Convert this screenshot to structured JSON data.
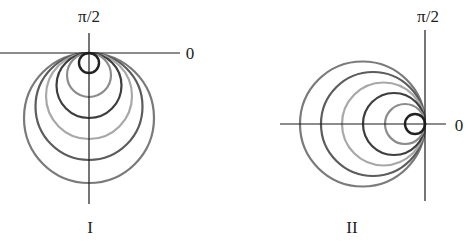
{
  "figure": {
    "panels": [
      {
        "id": "I",
        "caption": "I",
        "angle_label_top": "π/2",
        "angle_label_right": "0",
        "origin": [
          89,
          53
        ],
        "direction": "down",
        "circles": [
          {
            "diameter": 130,
            "color": "#7a7a7a"
          },
          {
            "diameter": 107,
            "color": "#5c5c5c"
          },
          {
            "diameter": 86,
            "color": "#a8a8a8"
          },
          {
            "diameter": 65,
            "color": "#3e3e3e"
          },
          {
            "diameter": 44,
            "color": "#8c8c8c"
          },
          {
            "diameter": 20,
            "color": "#222222"
          }
        ]
      },
      {
        "id": "II",
        "caption": "II",
        "angle_label_top": "π/2",
        "angle_label_right": "0",
        "origin": [
          425,
          124
        ],
        "direction": "left",
        "circles": [
          {
            "diameter": 125,
            "color": "#7a7a7a"
          },
          {
            "diameter": 104,
            "color": "#5c5c5c"
          },
          {
            "diameter": 83,
            "color": "#a8a8a8"
          },
          {
            "diameter": 62,
            "color": "#3e3e3e"
          },
          {
            "diameter": 40,
            "color": "#8c8c8c"
          },
          {
            "diameter": 20,
            "color": "#222222"
          }
        ]
      }
    ]
  }
}
